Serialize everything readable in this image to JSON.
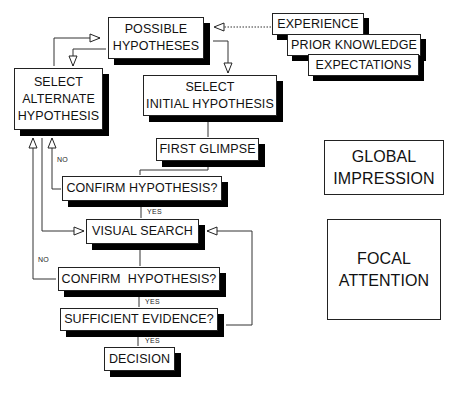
{
  "diagram": {
    "nodes": {
      "possible_hypotheses": {
        "line1": "POSSIBLE",
        "line2": "HYPOTHESES"
      },
      "select_alternate": {
        "line1": "SELECT",
        "line2": "ALTERNATE",
        "line3": "HYPOTHESIS"
      },
      "select_initial": {
        "line1": "SELECT",
        "line2": "INITIAL HYPOTHESIS"
      },
      "first_glimpse": {
        "label": "FIRST GLIMPSE"
      },
      "confirm_1": {
        "label": "CONFIRM HYPOTHESIS?"
      },
      "visual_search": {
        "label": "VISUAL SEARCH"
      },
      "confirm_2": {
        "label": "CONFIRM  HYPOTHESIS?"
      },
      "sufficient_evidence": {
        "label": "SUFFICIENT EVIDENCE?"
      },
      "decision": {
        "label": "DECISION"
      },
      "experience": {
        "label": "EXPERIENCE"
      },
      "prior_knowledge": {
        "label": "PRIOR KNOWLEDGE"
      },
      "expectations": {
        "label": "EXPECTATIONS"
      }
    },
    "legend": {
      "global_impression": {
        "line1": "GLOBAL",
        "line2": "IMPRESSION"
      },
      "focal_attention": {
        "line1": "FOCAL",
        "line2": "ATTENTION"
      }
    },
    "edge_labels": {
      "no_1": "NO",
      "yes_1": "YES",
      "no_2": "NO",
      "yes_2": "YES",
      "yes_3": "YES"
    },
    "edges": [
      {
        "from": "experience",
        "to": "possible_hypotheses",
        "style": "dotted"
      },
      {
        "from": "possible_hypotheses",
        "to": "select_initial"
      },
      {
        "from": "possible_hypotheses",
        "to": "select_alternate"
      },
      {
        "from": "select_alternate",
        "to": "possible_hypotheses"
      },
      {
        "from": "select_initial",
        "to": "first_glimpse"
      },
      {
        "from": "first_glimpse",
        "to": "confirm_1"
      },
      {
        "from": "confirm_1",
        "to": "select_alternate",
        "label": "NO"
      },
      {
        "from": "confirm_1",
        "to": "visual_search",
        "label": "YES"
      },
      {
        "from": "select_alternate",
        "to": "visual_search"
      },
      {
        "from": "visual_search",
        "to": "confirm_2"
      },
      {
        "from": "confirm_2",
        "to": "select_alternate",
        "label": "NO"
      },
      {
        "from": "confirm_2",
        "to": "sufficient_evidence",
        "label": "YES"
      },
      {
        "from": "sufficient_evidence",
        "to": "visual_search"
      },
      {
        "from": "sufficient_evidence",
        "to": "decision",
        "label": "YES"
      }
    ]
  }
}
